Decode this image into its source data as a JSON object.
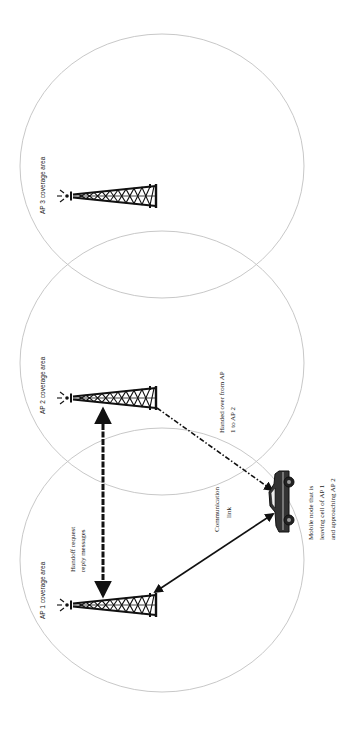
{
  "diagram": {
    "type": "wireless-handoff",
    "orientation": "rotated-90-ccw",
    "coverage_areas": [
      {
        "id": "ap3",
        "label": "AP 3 coverage area",
        "cx": 162,
        "cy": 166,
        "rx": 142,
        "ry": 132
      },
      {
        "id": "ap2",
        "label": "AP 2 coverage area",
        "cx": 162,
        "cy": 363,
        "rx": 142,
        "ry": 132
      },
      {
        "id": "ap1",
        "label": "AP 1 coverage area",
        "cx": 162,
        "cy": 560,
        "rx": 142,
        "ry": 132
      }
    ],
    "towers": [
      {
        "id": "tower-ap3",
        "x": 70,
        "y": 196
      },
      {
        "id": "tower-ap2",
        "x": 70,
        "y": 398
      },
      {
        "id": "tower-ap1",
        "x": 70,
        "y": 604
      }
    ],
    "annotations": {
      "handoff_messages": [
        "Handoff request",
        "reply messages"
      ],
      "handed_over": [
        "Handed over from AP",
        "1 to AP 2"
      ],
      "communication_link": [
        "Communication",
        "link"
      ],
      "mobile_node": [
        "Mobile node that is",
        "leaving cell of AP 1",
        "and approaching AP 2"
      ]
    },
    "links": [
      {
        "id": "handoff-link",
        "from": "tower-ap1",
        "to": "tower-ap2",
        "style": "dashed-double-arrow"
      },
      {
        "id": "communication-link",
        "from": "tower-ap1",
        "to": "mobile-node",
        "style": "solid-double-arrow"
      },
      {
        "id": "handover-link",
        "from": "tower-ap2",
        "to": "mobile-node",
        "style": "dash-dot-arrow"
      }
    ],
    "colors": {
      "cell_outline": "#c8c8c8",
      "ink": "#111111",
      "background": "#ffffff"
    }
  }
}
